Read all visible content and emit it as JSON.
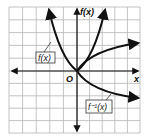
{
  "figure": {
    "type": "function-inverse-graph",
    "grid": {
      "columns": 10,
      "rows": 10
    },
    "axes": {
      "x_label": "x",
      "y_label": "f(x)",
      "origin_label": "O"
    },
    "curves": [
      {
        "name": "f(x)",
        "label": "f(x)",
        "description": "parabola-like curve through origin, opening upward"
      },
      {
        "name": "f^-1(x)",
        "label": "f⁻¹(x)",
        "description": "inverse relation: sideways parabola through origin opening right"
      }
    ],
    "colors": {
      "grid": "#b5b5b5",
      "axes": "#111111",
      "curve": "#111111"
    }
  }
}
